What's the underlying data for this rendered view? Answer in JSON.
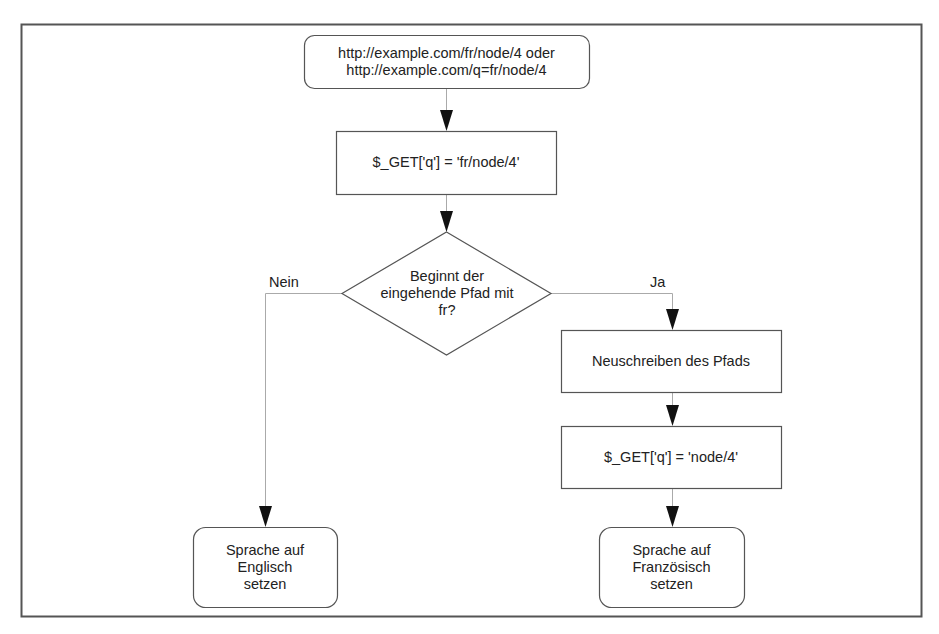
{
  "diagram": {
    "type": "flowchart",
    "colors": {
      "stroke": "#555555",
      "connector": "#aaaaaa",
      "arrow": "#111111",
      "frame": "#555555",
      "text": "#222222"
    },
    "nodes": [
      {
        "id": "start",
        "shape": "rounded-rect",
        "label": "http://example.com/fr/node/4 oder\nhttp://example.com/q=fr/node/4"
      },
      {
        "id": "get-full",
        "shape": "rect",
        "label": "$_GET['q'] = 'fr/node/4'"
      },
      {
        "id": "decision",
        "shape": "diamond",
        "label": "Beginnt der\neingehende Pfad mit\nfr?"
      },
      {
        "id": "rewrite",
        "shape": "rect",
        "label": "Neuschreiben des Pfads"
      },
      {
        "id": "get-stripped",
        "shape": "rect",
        "label": "$_GET['q'] = 'node/4'"
      },
      {
        "id": "set-english",
        "shape": "rounded-rect",
        "label": "Sprache auf\nEnglisch\nsetzen"
      },
      {
        "id": "set-french",
        "shape": "rounded-rect",
        "label": "Sprache auf\nFranzösisch\nsetzen"
      }
    ],
    "edges": [
      {
        "from": "start",
        "to": "get-full",
        "label": ""
      },
      {
        "from": "get-full",
        "to": "decision",
        "label": ""
      },
      {
        "from": "decision",
        "to": "set-english",
        "label": "Nein"
      },
      {
        "from": "decision",
        "to": "rewrite",
        "label": "Ja"
      },
      {
        "from": "rewrite",
        "to": "get-stripped",
        "label": ""
      },
      {
        "from": "get-stripped",
        "to": "set-french",
        "label": ""
      }
    ]
  }
}
